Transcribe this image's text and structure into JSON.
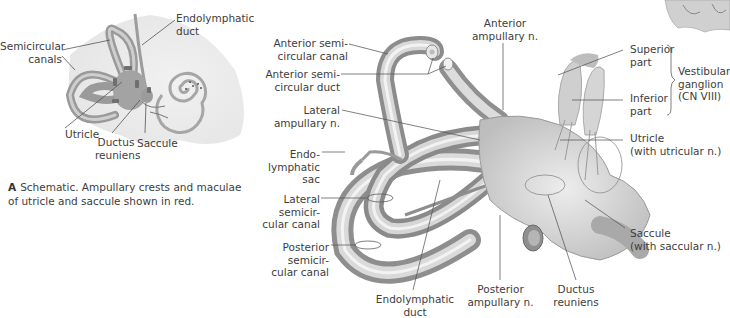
{
  "figure_a": {
    "labels": {
      "semicircular_canals": "Semicircular\ncanals",
      "endolymphatic_duct": "Endolymphatic\nduct",
      "utricle": "Utricle",
      "ductus_reuniens": "Ductus\nreuniens",
      "saccule": "Saccule"
    },
    "caption": {
      "letter": "A",
      "text": "Schematic. Ampullary crests and maculae\nof utricle and saccule shown in red."
    },
    "colors": {
      "labyrinth": "#9a9a9a",
      "background_blob": "#eeeeee",
      "macula": "#6e6e6e"
    }
  },
  "figure_b": {
    "labels": {
      "anterior_semicircular_canal": "Anterior semi-\ncircular canal",
      "anterior_semicircular_duct": "Anterior semi-\ncircular duct",
      "lateral_ampullary_n": "Lateral\nampullary n.",
      "endolymphatic_sac": "Endo-\nlymphatic\nsac",
      "lateral_semicircular_canal": "Lateral\nsemicir-\ncular canal",
      "posterior_semicircular_canal": "Posterior\nsemicir-\ncular canal",
      "endolymphatic_duct": "Endolymphatic\nduct",
      "anterior_ampullary_n": "Anterior\nampullary n.",
      "superior_part": "Superior\npart",
      "inferior_part": "Inferior\npart",
      "vestibular_ganglion": "Vestibular\nganglion\n(CN VIII)",
      "utricle": "Utricle\n(with utricular n.)",
      "saccule": "Saccule\n(with saccular n.)",
      "posterior_ampullary_n": "Posterior\nampullary n.",
      "ductus_reuniens": "Ductus\nreuniens"
    },
    "colors": {
      "tube_light": "#e6e6e6",
      "tube_mid": "#bdbdbd",
      "tube_dark": "#8c8c8c",
      "leader": "#555555"
    }
  }
}
